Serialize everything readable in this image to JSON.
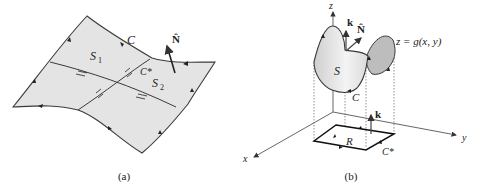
{
  "figure_a": {
    "caption": "(a)",
    "labels": {
      "curve_C": "C",
      "normal_N": "N̂",
      "surface_S1": "S",
      "surface_S1_sub": "1",
      "surface_S2": "S",
      "surface_S2_sub": "2",
      "curve_Cstar": "C*"
    }
  },
  "figure_b": {
    "caption": "(b)",
    "labels": {
      "axis_z": "z",
      "axis_x": "x",
      "axis_y": "y",
      "vector_k_top": "k",
      "normal_N": "N̂",
      "surface_eq": "z = g(x, y)",
      "surface_S": "S",
      "curve_C": "C",
      "vector_k_bottom": "k",
      "region_R": "R",
      "curve_Cstar": "C*"
    }
  },
  "colors": {
    "surface_fill": "#e2e2e2",
    "surface_dark": "#b4b4b4",
    "stroke": "#3a3a3a"
  }
}
